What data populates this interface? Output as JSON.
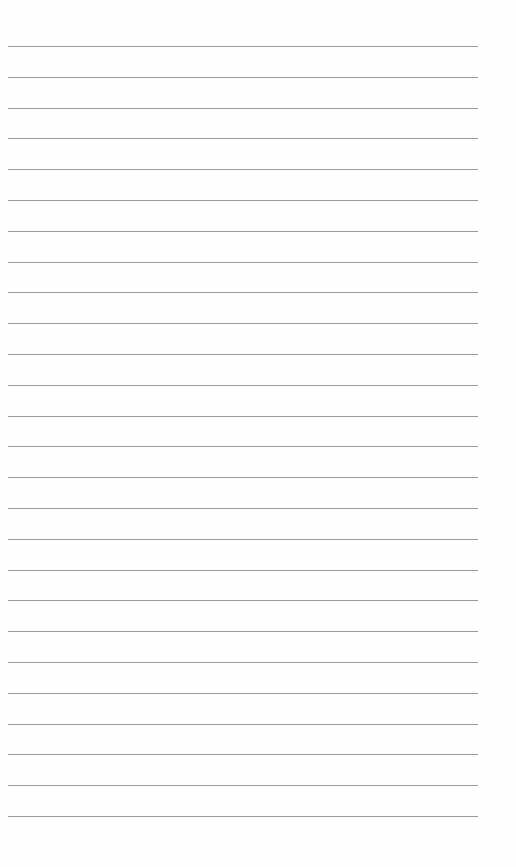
{
  "paper": {
    "type": "lined-paper",
    "line_count": 26,
    "first_line_y": 46,
    "line_spacing": 30.8,
    "line_left": 8,
    "line_width": 470,
    "line_color": "#9a9a9a",
    "background": "#fefefe"
  }
}
